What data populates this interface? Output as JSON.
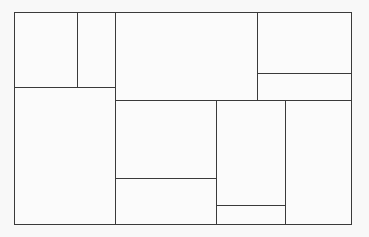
{
  "diagram": {
    "type": "rectangle-partition",
    "line_color": "#3a3a3a",
    "background": "#f8f8f8",
    "outer": {
      "x": 14,
      "y": 12,
      "w": 338,
      "h": 213
    },
    "cells": [
      {
        "id": "a",
        "label": "",
        "x": 14,
        "y": 12,
        "w": 64,
        "h": 76
      },
      {
        "id": "b",
        "label": "",
        "x": 77,
        "y": 12,
        "w": 39,
        "h": 76
      },
      {
        "id": "c",
        "label": "",
        "x": 115,
        "y": 12,
        "w": 143,
        "h": 89
      },
      {
        "id": "d",
        "label": "",
        "x": 257,
        "y": 12,
        "w": 95,
        "h": 62
      },
      {
        "id": "e",
        "label": "",
        "x": 257,
        "y": 73,
        "w": 95,
        "h": 28
      },
      {
        "id": "f",
        "label": "",
        "x": 14,
        "y": 87,
        "w": 102,
        "h": 138
      },
      {
        "id": "g",
        "label": "",
        "x": 115,
        "y": 100,
        "w": 102,
        "h": 79
      },
      {
        "id": "h",
        "label": "",
        "x": 115,
        "y": 178,
        "w": 102,
        "h": 47
      },
      {
        "id": "i",
        "label": "",
        "x": 216,
        "y": 100,
        "w": 70,
        "h": 106
      },
      {
        "id": "j",
        "label": "",
        "x": 216,
        "y": 205,
        "w": 70,
        "h": 20
      },
      {
        "id": "k",
        "label": "",
        "x": 285,
        "y": 100,
        "w": 67,
        "h": 125
      }
    ]
  }
}
